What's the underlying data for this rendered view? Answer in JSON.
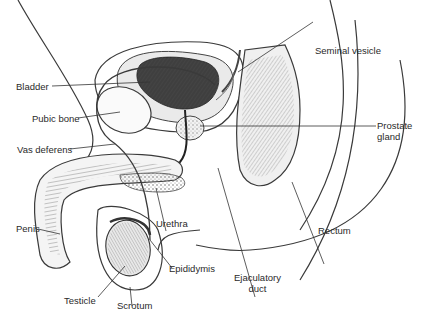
{
  "diagram": {
    "type": "anatomical-illustration",
    "labels": [
      {
        "id": "bladder",
        "text": "Bladder"
      },
      {
        "id": "pubic-bone",
        "text": "Pubic bone"
      },
      {
        "id": "vas-deferens",
        "text": "Vas deferens"
      },
      {
        "id": "penis",
        "text": "Penis"
      },
      {
        "id": "testicle",
        "text": "Testicle"
      },
      {
        "id": "scrotum",
        "text": "Scrotum"
      },
      {
        "id": "urethra",
        "text": "Urethra"
      },
      {
        "id": "epididymis",
        "text": "Epididymis"
      },
      {
        "id": "ejaculatory-duct",
        "line1": "Ejaculatory",
        "line2": "duct"
      },
      {
        "id": "rectum",
        "text": "Rectum"
      },
      {
        "id": "prostate-gland",
        "line1": "Prostate",
        "line2": "gland"
      },
      {
        "id": "seminal-vesicle",
        "text": "Seminal vesicle"
      }
    ],
    "colors": {
      "line": "#3a3a3a",
      "bladder_fill": "#4a4a4a",
      "background": "#ffffff"
    }
  }
}
